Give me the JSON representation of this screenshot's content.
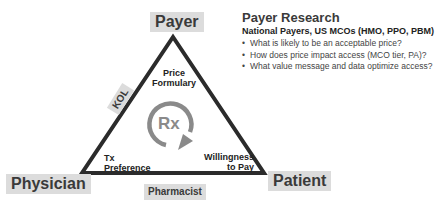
{
  "diagram": {
    "nodes": {
      "payer": "Payer",
      "physician": "Physician",
      "patient": "Patient",
      "pharmacist": "Pharmacist",
      "kol": "KOL"
    },
    "inner_labels": {
      "price_formulary": [
        "Price",
        "Formulary"
      ],
      "tx_preference": [
        "Tx",
        "Preference"
      ],
      "willingness_to_pay": [
        "Willingness",
        "to Pay"
      ]
    },
    "center": {
      "label": "Rx",
      "icon": "circular-arrow-icon"
    },
    "colors": {
      "triangle_stroke": "#2b2b2b",
      "label_box_fill": "#dcdcdc",
      "arrow_gray": "#8a8a8a"
    }
  },
  "panel": {
    "title": "Payer Research",
    "subtitle": "National Payers, US MCOs (HMO, PPO, PBM)",
    "bullets": [
      "What is likely to be an acceptable price?",
      "How does price impact access (MCO tier, PA)?",
      "What value message and data optimize access?"
    ]
  }
}
